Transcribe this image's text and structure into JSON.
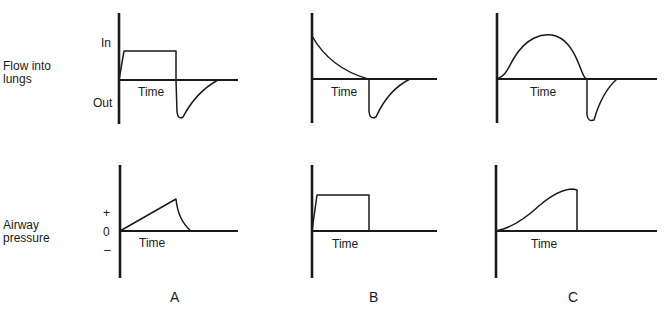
{
  "rows": {
    "flow": {
      "label_line1": "Flow into",
      "label_line2": "lungs",
      "tick_in": "In",
      "tick_out": "Out"
    },
    "pressure": {
      "label_line1": "Airway",
      "label_line2": "pressure",
      "tick_plus": "+",
      "tick_zero": "0",
      "tick_minus": "–"
    }
  },
  "time_label": "Time",
  "panels": [
    {
      "id": "A",
      "letter": "A",
      "flow_shape": "square inspiratory flow, passive exponential expiratory flow",
      "pressure_shape": "linear ramp then exponential decay"
    },
    {
      "id": "B",
      "letter": "B",
      "flow_shape": "decelerating inspiratory flow, passive exponential expiratory flow",
      "pressure_shape": "square (constant) pressure"
    },
    {
      "id": "C",
      "letter": "C",
      "flow_shape": "sinusoidal inspiratory flow, passive exponential expiratory flow",
      "pressure_shape": "sigmoidal rise then abrupt drop"
    }
  ]
}
